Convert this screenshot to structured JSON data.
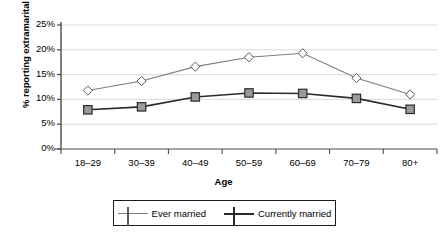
{
  "chart_data": {
    "type": "line",
    "title": "",
    "xlabel": "Age",
    "ylabel": "% reporting extramarital sex",
    "categories": [
      "18–29",
      "30–39",
      "40–49",
      "50–59",
      "60–69",
      "70–79",
      "80+"
    ],
    "ylim": [
      0,
      25
    ],
    "ytick_labels": [
      "0%",
      "5%",
      "10%",
      "15%",
      "20%",
      "25%"
    ],
    "ytick_values": [
      0,
      5,
      10,
      15,
      20,
      25
    ],
    "grid": "horizontal",
    "legend_position": "bottom",
    "series": [
      {
        "name": "Ever married",
        "values": [
          11.8,
          13.7,
          16.6,
          18.5,
          19.3,
          14.3,
          11.0
        ],
        "marker": "diamond",
        "marker_fill": "#ffffff",
        "marker_edge": "#5a5a5a",
        "line_color": "#7d7d7d"
      },
      {
        "name": "Currently married",
        "values": [
          7.9,
          8.5,
          10.5,
          11.3,
          11.2,
          10.2,
          8.0
        ],
        "marker": "square",
        "marker_fill": "#9a9a9a",
        "marker_edge": "#2b2b2b",
        "line_color": "#2b2b2b"
      }
    ],
    "colors": {
      "axis": "#4a4a4a",
      "grid": "#d9d9d9",
      "background": "#ffffff",
      "text": "#000000"
    }
  }
}
